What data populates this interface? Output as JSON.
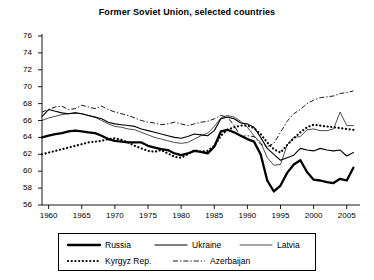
{
  "chart_data": {
    "type": "line",
    "title": "Former Soviet Union, selected countries",
    "xlabel": "",
    "ylabel": "",
    "xlim": [
      1959,
      2007
    ],
    "ylim": [
      56,
      76
    ],
    "xticks": [
      1960,
      1965,
      1970,
      1975,
      1980,
      1985,
      1990,
      1995,
      2000,
      2005
    ],
    "yticks": [
      56,
      58,
      60,
      62,
      64,
      66,
      68,
      70,
      72,
      74,
      76
    ],
    "grid": false,
    "legend_position": "bottom",
    "series": [
      {
        "name": "Russia",
        "style": "thick-solid",
        "color": "#000000",
        "x": [
          1959,
          1960,
          1961,
          1962,
          1963,
          1964,
          1965,
          1966,
          1967,
          1968,
          1969,
          1970,
          1971,
          1972,
          1973,
          1974,
          1975,
          1976,
          1977,
          1978,
          1979,
          1980,
          1981,
          1982,
          1983,
          1984,
          1985,
          1986,
          1987,
          1988,
          1989,
          1990,
          1991,
          1992,
          1993,
          1994,
          1995,
          1996,
          1997,
          1998,
          1999,
          2000,
          2001,
          2002,
          2003,
          2004,
          2005,
          2006
        ],
        "values": [
          64.0,
          64.2,
          64.4,
          64.5,
          64.7,
          64.8,
          64.7,
          64.6,
          64.5,
          64.2,
          63.8,
          63.6,
          63.5,
          63.4,
          63.4,
          63.4,
          63.0,
          62.8,
          62.6,
          62.5,
          62.1,
          61.9,
          62.1,
          62.4,
          62.3,
          62.1,
          62.9,
          64.7,
          64.9,
          64.6,
          64.2,
          63.8,
          63.5,
          62.0,
          58.9,
          57.6,
          58.3,
          59.8,
          60.8,
          61.3,
          59.9,
          59.0,
          58.9,
          58.7,
          58.6,
          59.1,
          58.9,
          60.4
        ]
      },
      {
        "name": "Ukraine",
        "style": "medium-solid",
        "color": "#000000",
        "x": [
          1959,
          1960,
          1961,
          1962,
          1963,
          1964,
          1965,
          1966,
          1967,
          1968,
          1969,
          1970,
          1971,
          1972,
          1973,
          1974,
          1975,
          1976,
          1977,
          1978,
          1979,
          1980,
          1981,
          1982,
          1983,
          1984,
          1985,
          1986,
          1987,
          1988,
          1989,
          1990,
          1991,
          1992,
          1993,
          1994,
          1995,
          1996,
          1997,
          1998,
          1999,
          2000,
          2001,
          2002,
          2003,
          2004,
          2005,
          2006
        ],
        "values": [
          66.5,
          67.3,
          67.1,
          66.9,
          66.8,
          66.9,
          66.8,
          66.6,
          66.4,
          66.2,
          65.8,
          65.6,
          65.5,
          65.4,
          65.3,
          65.0,
          64.8,
          64.6,
          64.4,
          64.2,
          64.0,
          63.9,
          64.1,
          64.4,
          64.3,
          64.2,
          64.8,
          66.2,
          66.4,
          66.2,
          65.7,
          65.6,
          65.2,
          64.0,
          62.7,
          62.0,
          61.3,
          61.6,
          61.9,
          62.7,
          62.5,
          62.4,
          62.7,
          62.5,
          62.4,
          62.5,
          61.8,
          62.2
        ]
      },
      {
        "name": "Latvia",
        "style": "thin-solid",
        "color": "#000000",
        "x": [
          1959,
          1960,
          1961,
          1962,
          1963,
          1964,
          1965,
          1966,
          1967,
          1968,
          1969,
          1970,
          1971,
          1972,
          1973,
          1974,
          1975,
          1976,
          1977,
          1978,
          1979,
          1980,
          1981,
          1982,
          1983,
          1984,
          1985,
          1986,
          1987,
          1988,
          1989,
          1990,
          1991,
          1992,
          1993,
          1994,
          1995,
          1996,
          1997,
          1998,
          1999,
          2000,
          2001,
          2002,
          2003,
          2004,
          2005,
          2006
        ],
        "values": [
          66.0,
          66.3,
          66.5,
          66.7,
          66.8,
          66.9,
          66.8,
          66.6,
          66.4,
          66.0,
          65.6,
          65.3,
          65.2,
          65.0,
          64.9,
          64.6,
          64.3,
          64.0,
          63.8,
          63.6,
          63.4,
          63.3,
          63.4,
          63.8,
          64.2,
          64.5,
          65.3,
          66.3,
          66.6,
          66.4,
          65.9,
          65.2,
          64.2,
          63.4,
          61.6,
          60.7,
          60.8,
          63.1,
          64.0,
          64.1,
          64.9,
          65.0,
          64.8,
          64.8,
          65.0,
          67.0,
          65.4,
          65.4
        ]
      },
      {
        "name": "Kyrgyz Rep.",
        "style": "dotted",
        "color": "#000000",
        "x": [
          1959,
          1960,
          1961,
          1962,
          1963,
          1964,
          1965,
          1966,
          1967,
          1968,
          1969,
          1970,
          1971,
          1972,
          1973,
          1974,
          1975,
          1976,
          1977,
          1978,
          1979,
          1980,
          1981,
          1982,
          1983,
          1984,
          1985,
          1986,
          1987,
          1988,
          1989,
          1990,
          1991,
          1992,
          1993,
          1994,
          1995,
          1996,
          1997,
          1998,
          1999,
          2000,
          2001,
          2002,
          2003,
          2004,
          2005,
          2006
        ],
        "values": [
          62.0,
          62.2,
          62.4,
          62.6,
          62.8,
          63.0,
          63.2,
          63.4,
          63.5,
          63.6,
          63.8,
          63.9,
          63.7,
          63.4,
          63.0,
          62.7,
          62.4,
          62.3,
          62.5,
          62.1,
          61.7,
          61.6,
          62.0,
          62.5,
          62.3,
          62.4,
          63.0,
          64.2,
          64.9,
          65.2,
          65.4,
          65.4,
          65.1,
          64.4,
          63.4,
          62.6,
          62.2,
          63.1,
          63.9,
          64.6,
          65.2,
          65.5,
          65.4,
          65.3,
          65.2,
          65.1,
          65.0,
          64.9
        ]
      },
      {
        "name": "Azerbaijan",
        "style": "dash-dot",
        "color": "#000000",
        "x": [
          1959,
          1960,
          1961,
          1962,
          1963,
          1964,
          1965,
          1966,
          1967,
          1968,
          1969,
          1970,
          1971,
          1972,
          1973,
          1974,
          1975,
          1976,
          1977,
          1978,
          1979,
          1980,
          1981,
          1982,
          1983,
          1984,
          1985,
          1986,
          1987,
          1988,
          1989,
          1990,
          1991,
          1992,
          1993,
          1994,
          1995,
          1996,
          1997,
          1998,
          1999,
          2000,
          2001,
          2002,
          2003,
          2004,
          2005,
          2006
        ],
        "values": [
          67.0,
          67.3,
          67.6,
          67.7,
          67.3,
          67.4,
          67.8,
          67.6,
          67.4,
          67.7,
          67.3,
          67.0,
          66.8,
          66.6,
          66.3,
          66.0,
          65.8,
          65.7,
          65.5,
          65.6,
          65.8,
          65.6,
          65.4,
          65.6,
          65.8,
          65.9,
          66.2,
          66.6,
          66.4,
          65.4,
          64.1,
          64.2,
          64.1,
          63.2,
          62.9,
          63.3,
          64.6,
          65.9,
          66.8,
          67.3,
          68.0,
          68.4,
          68.7,
          68.8,
          68.9,
          69.2,
          69.3,
          69.5
        ]
      }
    ]
  },
  "legend": {
    "entries": [
      {
        "label": "Russia",
        "style": "thick-solid"
      },
      {
        "label": "Ukraine",
        "style": "medium-solid"
      },
      {
        "label": "Latvia",
        "style": "thin-solid"
      },
      {
        "label": "Kyrgyz Rep.",
        "style": "dotted"
      },
      {
        "label": "Azerbaijan",
        "style": "dash-dot"
      }
    ]
  }
}
